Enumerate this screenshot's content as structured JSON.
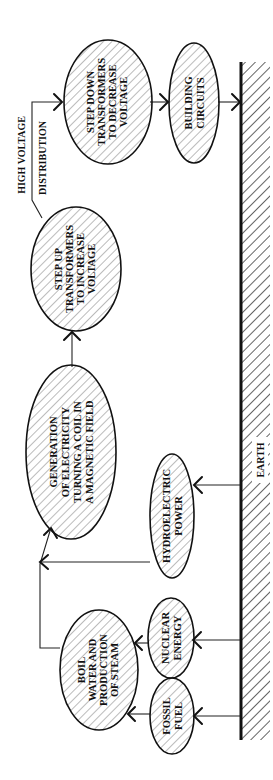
{
  "diagram": {
    "title": "",
    "orientation": "rotated-90-ccw",
    "nodes": {
      "step_down": {
        "lines": [
          "STEP DOWN",
          "TRANSFORMERS",
          "TO DECREASE",
          "VOLTAGE"
        ]
      },
      "building": {
        "lines": [
          "BUILDING",
          "CIRCUITS"
        ]
      },
      "step_up": {
        "lines": [
          "STEP UP",
          "TRANSFORMERS",
          "TO INCREASE",
          "VOLTAGE"
        ]
      },
      "generation": {
        "lines": [
          "GENERATION",
          "OF ELECTRICITY",
          "TURNING A COIL IN",
          "A MAGNETIC FIELD"
        ]
      },
      "hydro": {
        "lines": [
          "HYDROELECTRIC",
          "POWER"
        ]
      },
      "boil": {
        "lines": [
          "BOIL",
          "WATER AND",
          "PRODUCTION",
          "OF STEAM"
        ]
      },
      "nuclear": {
        "lines": [
          "NUCLEAR",
          "ENERGY"
        ]
      },
      "fossil": {
        "lines": [
          "FOSSIL",
          "FUEL"
        ]
      }
    },
    "labels": {
      "high_voltage": "HIGH VOLTAGE",
      "distribution": "DISTRIBUTION",
      "earth": "EARTH"
    },
    "edges": [
      {
        "from": "EARTH",
        "to": "FOSSIL FUEL"
      },
      {
        "from": "EARTH",
        "to": "NUCLEAR ENERGY"
      },
      {
        "from": "EARTH",
        "to": "HYDROELECTRIC POWER"
      },
      {
        "from": "FOSSIL FUEL",
        "to": "BOIL WATER AND PRODUCTION OF STEAM"
      },
      {
        "from": "NUCLEAR ENERGY",
        "to": "BOIL WATER AND PRODUCTION OF STEAM"
      },
      {
        "from": "BOIL WATER AND PRODUCTION OF STEAM",
        "to": "GENERATION OF ELECTRICITY TURNING A COIL IN A MAGNETIC FIELD"
      },
      {
        "from": "HYDROELECTRIC POWER",
        "to": "GENERATION OF ELECTRICITY TURNING A COIL IN A MAGNETIC FIELD"
      },
      {
        "from": "GENERATION OF ELECTRICITY TURNING A COIL IN A MAGNETIC FIELD",
        "to": "STEP UP TRANSFORMERS TO INCREASE VOLTAGE"
      },
      {
        "from": "STEP UP TRANSFORMERS TO INCREASE VOLTAGE",
        "to": "STEP DOWN TRANSFORMERS TO DECREASE VOLTAGE",
        "label": "HIGH VOLTAGE DISTRIBUTION"
      },
      {
        "from": "STEP DOWN TRANSFORMERS TO DECREASE VOLTAGE",
        "to": "BUILDING CIRCUITS"
      },
      {
        "from": "BUILDING CIRCUITS",
        "to": "EARTH"
      }
    ],
    "colors": {
      "ink": "#111111",
      "background": "#ffffff"
    }
  }
}
